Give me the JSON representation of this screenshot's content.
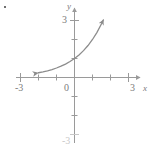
{
  "chart_data": {
    "type": "line",
    "title": "",
    "subtitle": "",
    "xlabel": "x",
    "ylabel": "y",
    "xlim": [
      -3,
      3
    ],
    "ylim": [
      -3,
      3
    ],
    "grid": false,
    "legend": null,
    "x_ticks": [
      -3,
      -2,
      -1,
      0,
      1,
      2,
      3
    ],
    "y_ticks": [
      -3,
      -2,
      -1,
      0,
      1,
      2,
      3
    ],
    "x_tick_labels_shown": [
      "-3",
      "",
      "",
      "0",
      "",
      "",
      "3"
    ],
    "y_tick_labels_shown": [
      "-3",
      "",
      "",
      "",
      "",
      "",
      "3"
    ],
    "series": [
      {
        "name": "exponential-curve",
        "color": "#8c8c8c",
        "arrow_start": true,
        "arrow_end": true,
        "x": [
          -2.0,
          -1.75,
          -1.5,
          -1.25,
          -1.0,
          -0.75,
          -0.5,
          -0.25,
          0.0,
          0.25,
          0.5,
          0.75,
          1.0,
          1.25,
          1.5,
          1.6
        ],
        "y": [
          0.25,
          0.297,
          0.354,
          0.42,
          0.5,
          0.595,
          0.707,
          0.841,
          1.0,
          1.189,
          1.414,
          1.682,
          2.0,
          2.378,
          2.828,
          3.03
        ]
      }
    ]
  },
  "labels": {
    "x_axis_name": "x",
    "y_axis_name": "y",
    "x_neg3": "-3",
    "x_pos3": "3",
    "origin": "0",
    "y_pos3": "3",
    "y_neg3": "-3"
  },
  "colors": {
    "curve": "#8c8c8c",
    "axis": "#9a9a9a",
    "text": "#7b7b7b",
    "background": "#ffffff"
  }
}
